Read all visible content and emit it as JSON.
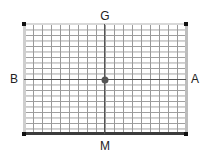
{
  "diagram": {
    "labels": {
      "top": "G",
      "bottom": "M",
      "left": "B",
      "right": "A"
    },
    "grid": {
      "columns": 18,
      "rows": 20,
      "line_color": "#9a9a9a"
    },
    "edges": {
      "top_color": "#d8d8d8",
      "left_color": "#cfcfcf",
      "right_color": "#bdbdbd",
      "bottom_color": "#3c3c3c"
    },
    "center_dot_color": "#555555",
    "corner_marker_color": "#111111"
  }
}
